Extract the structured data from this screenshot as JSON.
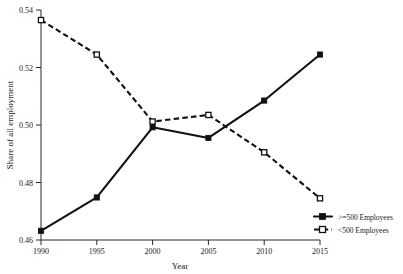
{
  "chart_data": {
    "type": "line",
    "title": "",
    "xlabel": "Year",
    "ylabel": "Share of all employment",
    "x": [
      1990,
      1995,
      2000,
      2005,
      2010,
      2015
    ],
    "xticklabels": [
      "1990",
      "1995",
      "2000",
      "2005",
      "2010",
      "2015"
    ],
    "yticklabels": [
      "0.46",
      "0.48",
      "0.50",
      "0.52",
      "0.54"
    ],
    "yticks": [
      0.46,
      0.48,
      0.5,
      0.52,
      0.54
    ],
    "xlim": [
      1990,
      2015
    ],
    "ylim": [
      0.46,
      0.54
    ],
    "grid": false,
    "legend_position": "right",
    "series": [
      {
        "name": ">=500 Employees",
        "values": [
          0.4632,
          0.4748,
          0.4992,
          0.4955,
          0.5085,
          0.5245
        ],
        "line_style": "solid",
        "marker": "filled-square",
        "color": "#111111"
      },
      {
        "name": "<500 Employees",
        "values": [
          0.5365,
          0.5245,
          0.5012,
          0.5035,
          0.4905,
          0.4745
        ],
        "line_style": "dashed",
        "marker": "open-square",
        "color": "#111111"
      }
    ]
  },
  "legend": {
    "entries": [
      {
        "label": ">=500 Employees"
      },
      {
        "label": "<500 Employees"
      }
    ]
  },
  "axes": {
    "x_title": "Year",
    "y_title": "Share of all employment"
  }
}
